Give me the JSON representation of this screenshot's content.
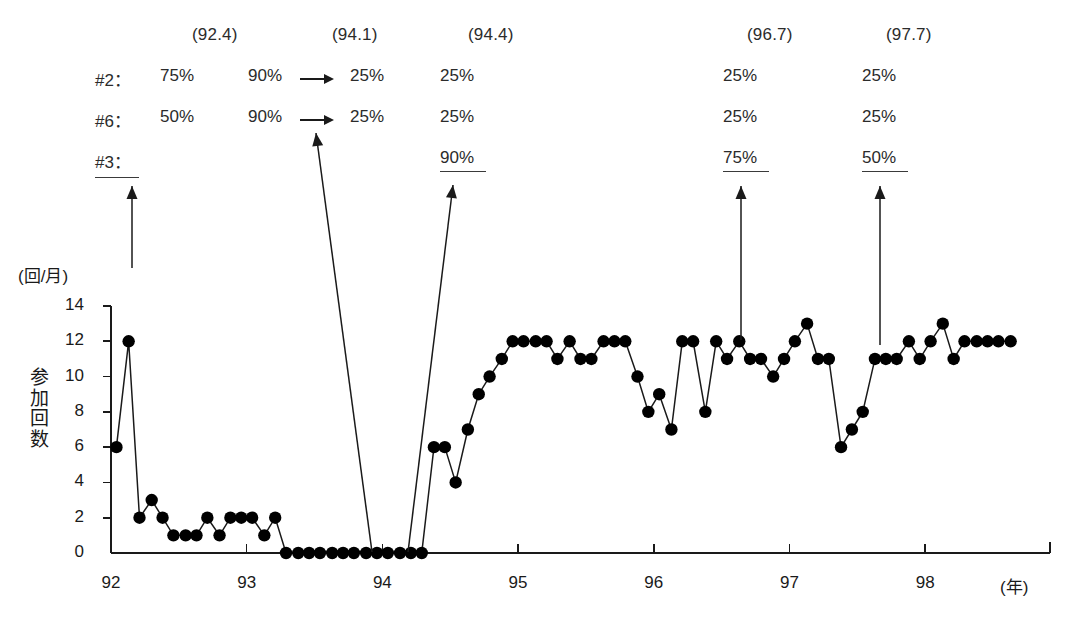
{
  "annotation": {
    "dates": [
      {
        "label": "(92.4)",
        "x": 192
      },
      {
        "label": "(94.1)",
        "x": 332
      },
      {
        "label": "(94.4)",
        "x": 468
      },
      {
        "label": "(96.7)",
        "x": 747
      },
      {
        "label": "(97.7)",
        "x": 886
      }
    ],
    "rows": [
      {
        "name": "#2：",
        "cells": [
          {
            "text": "75%",
            "x": 160
          },
          {
            "text": "90%",
            "x": 248
          },
          {
            "text": "25%",
            "x": 350
          },
          {
            "text": "25%",
            "x": 440
          },
          {
            "text": "25%",
            "x": 723
          },
          {
            "text": "25%",
            "x": 862
          }
        ],
        "arrow": {
          "x": 300,
          "w": 34
        }
      },
      {
        "name": "#6：",
        "cells": [
          {
            "text": "50%",
            "x": 160
          },
          {
            "text": "90%",
            "x": 248
          },
          {
            "text": "25%",
            "x": 350
          },
          {
            "text": "25%",
            "x": 440
          },
          {
            "text": "25%",
            "x": 723
          },
          {
            "text": "25%",
            "x": 862
          }
        ],
        "arrow": {
          "x": 300,
          "w": 34
        }
      },
      {
        "name": "#3：",
        "cells": [
          {
            "text": "90%",
            "x": 440
          },
          {
            "text": "75%",
            "x": 723
          },
          {
            "text": "50%",
            "x": 862
          }
        ],
        "arrow": null
      }
    ]
  },
  "chart_data": {
    "type": "line",
    "title": "",
    "xlabel": "(年)",
    "ylabel": "参加回数",
    "yunit": "(回/月)",
    "yticks": [
      0,
      2,
      4,
      6,
      8,
      10,
      12,
      14
    ],
    "ylim": [
      0,
      14
    ],
    "xticks": [
      "92",
      "93",
      "94",
      "95",
      "96",
      "97",
      "98"
    ],
    "xlim": [
      92.0,
      98.9
    ],
    "grid": false,
    "legend": "none",
    "marker": "filled-circle",
    "series": [
      {
        "name": "参加回数",
        "x": [
          92.04,
          92.13,
          92.21,
          92.3,
          92.38,
          92.46,
          92.55,
          92.63,
          92.71,
          92.8,
          92.88,
          92.96,
          93.04,
          93.13,
          93.21,
          93.29,
          93.38,
          93.46,
          93.54,
          93.63,
          93.71,
          93.79,
          93.88,
          93.96,
          94.04,
          94.13,
          94.21,
          94.29,
          94.38,
          94.46,
          94.54,
          94.63,
          94.71,
          94.79,
          94.88,
          94.96,
          95.04,
          95.13,
          95.21,
          95.29,
          95.38,
          95.46,
          95.54,
          95.63,
          95.71,
          95.79,
          95.88,
          95.96,
          96.04,
          96.13,
          96.21,
          96.29,
          96.38,
          96.46,
          96.54,
          96.63,
          96.71,
          96.79,
          96.88,
          96.96,
          97.04,
          97.13,
          97.21,
          97.29,
          97.38,
          97.46,
          97.54,
          97.63,
          97.71,
          97.79,
          97.88,
          97.96,
          98.04,
          98.13,
          98.21,
          98.29,
          98.38,
          98.46,
          98.54,
          98.63
        ],
        "values": [
          6,
          12,
          2,
          3,
          2,
          1,
          1,
          1,
          2,
          1,
          2,
          2,
          2,
          1,
          2,
          0,
          0,
          0,
          0,
          0,
          0,
          0,
          0,
          0,
          0,
          0,
          0,
          0,
          6,
          6,
          4,
          7,
          9,
          10,
          11,
          12,
          12,
          12,
          12,
          11,
          12,
          11,
          11,
          12,
          12,
          12,
          10,
          8,
          9,
          7,
          12,
          12,
          8,
          12,
          11,
          12,
          11,
          11,
          10,
          11,
          12,
          13,
          11,
          11,
          6,
          7,
          8,
          11,
          11,
          11,
          12,
          11,
          12,
          13,
          11,
          12,
          12,
          12,
          12,
          12
        ]
      }
    ],
    "annotations_on_plot": [
      {
        "name": "arrow-92-4",
        "type": "vertical-arrow",
        "from_x": 132,
        "from_y": 268,
        "to_x": 132,
        "to_y": 186
      },
      {
        "name": "arrow-94-1",
        "type": "slanted-arrow",
        "from_x": 372,
        "from_y": 552,
        "to_x": 316,
        "to_y": 133
      },
      {
        "name": "arrow-94-4",
        "type": "slanted-arrow",
        "from_x": 408,
        "from_y": 552,
        "to_x": 453,
        "to_y": 185
      },
      {
        "name": "arrow-96-7",
        "type": "vertical-arrow",
        "from_x": 741,
        "from_y": 340,
        "to_x": 741,
        "to_y": 186
      },
      {
        "name": "arrow-97-7",
        "type": "vertical-arrow",
        "from_x": 880,
        "from_y": 345,
        "to_x": 880,
        "to_y": 186
      }
    ]
  },
  "colors": {
    "ink": "#1a1a1a",
    "marker": "#000000",
    "line": "#1a1a1a",
    "axis": "#1a1a1a",
    "background": "#ffffff"
  }
}
